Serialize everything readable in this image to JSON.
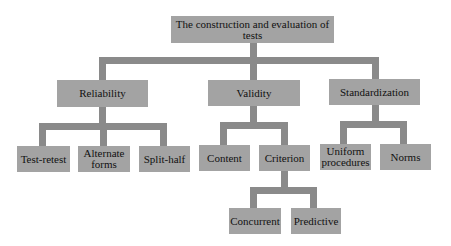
{
  "diagram": {
    "type": "hierarchy tree",
    "colors": {
      "node_fill": "#a3a3a3",
      "connector": "#8a8a8a",
      "background": "#ffffff",
      "text": "#111111"
    },
    "root": {
      "label": "The construction and evaluation of tests"
    },
    "branches": [
      {
        "label": "Reliability",
        "children": [
          {
            "label": "Test-retest"
          },
          {
            "label": "Alternate forms"
          },
          {
            "label": "Split-half"
          }
        ]
      },
      {
        "label": "Validity",
        "children": [
          {
            "label": "Content"
          },
          {
            "label": "Criterion",
            "children": [
              {
                "label": "Concurrent"
              },
              {
                "label": "Predictive"
              }
            ]
          }
        ]
      },
      {
        "label": "Standardization",
        "children": [
          {
            "label": "Uniform procedures"
          },
          {
            "label": "Norms"
          }
        ]
      }
    ]
  }
}
